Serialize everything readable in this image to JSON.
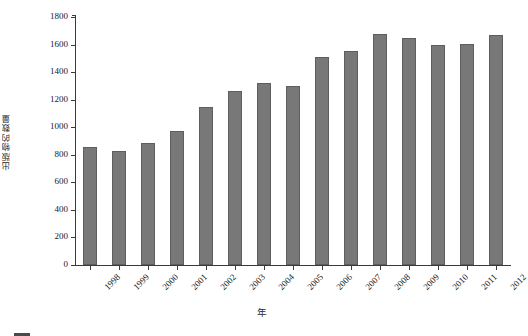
{
  "chart_data": {
    "type": "bar",
    "title": "",
    "xlabel": "年",
    "ylabel": "出版物的数量",
    "categories": [
      "1998",
      "1999",
      "2000",
      "2001",
      "2002",
      "2003",
      "2004",
      "2005",
      "2006",
      "2007",
      "2008",
      "2009",
      "2010",
      "2011",
      "2012"
    ],
    "values": [
      855,
      825,
      885,
      975,
      1150,
      1265,
      1320,
      1300,
      1510,
      1550,
      1680,
      1645,
      1600,
      1605,
      1670
    ],
    "ylim": [
      0,
      1800
    ],
    "yticks": [
      "0",
      "200",
      "400",
      "600",
      "800",
      "1000",
      "1200",
      "1400",
      "1600",
      "1800"
    ],
    "ytick_values": [
      0,
      200,
      400,
      600,
      800,
      1000,
      1200,
      1400,
      1600,
      1800
    ],
    "grid": false,
    "legend": null,
    "bar_color": "#787878",
    "bar_edge_color": "#5e5e5e",
    "axis_color": "#3a3a3a",
    "text_color": "#1a1a1a"
  },
  "caption": {
    "figure_marker": "图",
    "text": ""
  }
}
